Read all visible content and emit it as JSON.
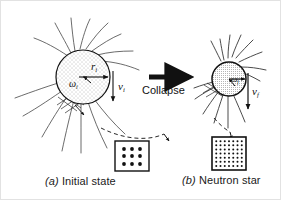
{
  "figure": {
    "width": 281,
    "height": 200,
    "background": "#ffffff",
    "ink": "#111111"
  },
  "captions": {
    "a_marker": "(a)",
    "a_text": " Initial state",
    "b_marker": "(b)",
    "b_text": " Neutron star"
  },
  "process": {
    "arrow_label": "Collapse",
    "arrow_direction": "right"
  },
  "left_star": {
    "name": "initial star",
    "radius_label": "r",
    "radius_sub": "i",
    "omega_label": "ω",
    "omega_sub": "i",
    "velocity_label": "v",
    "velocity_sub": "i",
    "fill": "stippled",
    "field_lines": 14
  },
  "right_star": {
    "name": "neutron star",
    "omega_label": "ω",
    "omega_sub": "f",
    "velocity_label": "v",
    "velocity_sub": "f",
    "fill": "dense-hatch",
    "field_lines": 16
  },
  "density_boxes": {
    "initial": {
      "rows": 3,
      "cols": 3,
      "dot_radius": 1.9,
      "label": "low density lattice"
    },
    "final": {
      "rows": 7,
      "cols": 7,
      "dot_radius": 1.0,
      "label": "high density lattice"
    }
  },
  "icons": {
    "collapse_arrow": "right-arrow-icon",
    "zoom_callout_initial": "dashed-callout-icon",
    "zoom_callout_final": "dashed-callout-icon"
  }
}
